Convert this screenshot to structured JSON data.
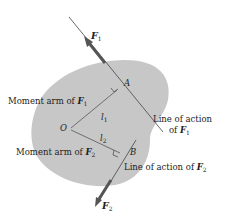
{
  "diagram": {
    "colors": {
      "body_fill": "#c7c7c7",
      "line": "#444444",
      "arrow": "#555555",
      "text": "#222222"
    },
    "forces": [
      {
        "name": "F",
        "subscript": "1"
      },
      {
        "name": "F",
        "subscript": "2"
      }
    ],
    "points": {
      "A": "A",
      "B": "B",
      "O": "O"
    },
    "lever_arms": [
      {
        "name": "l",
        "subscript": "1"
      },
      {
        "name": "l",
        "subscript": "2"
      }
    ],
    "labels": {
      "moment_arm_f1": "Moment arm of",
      "moment_arm_f2": "Moment arm of",
      "line_of_action_f1_line1": "Line of action",
      "line_of_action_f1_line2": "of",
      "line_of_action_f2": "Line of action of"
    }
  }
}
